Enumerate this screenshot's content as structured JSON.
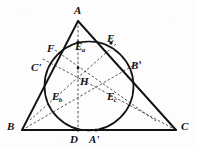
{
  "figure": {
    "background_color": "#fdfdfd",
    "ink_color": "#121212",
    "stroke_solid_width": 1.6,
    "stroke_dashed_width": 0.8,
    "dash_pattern": "2.5 2",
    "triangle": {
      "vertices": {
        "A": {
          "x": 78,
          "y": 21
        },
        "B": {
          "x": 22,
          "y": 130
        },
        "C": {
          "x": 176,
          "y": 130
        }
      }
    },
    "circle": {
      "cx": 89,
      "cy": 86,
      "r": 44.5
    },
    "orthocenter": {
      "x": 78,
      "y": 68
    },
    "points": [
      {
        "id": "D",
        "x": 78,
        "y": 130,
        "dot": true
      },
      {
        "id": "A'",
        "x": 96,
        "y": 130,
        "dot": true
      },
      {
        "id": "Ea",
        "x": 78,
        "y": 42,
        "dot": true
      },
      {
        "id": "E",
        "x": 111,
        "y": 43,
        "dot": true
      },
      {
        "id": "F",
        "x": 57,
        "y": 53,
        "dot": false
      },
      {
        "id": "C'",
        "x": 47,
        "y": 69,
        "dot": false
      },
      {
        "id": "B'",
        "x": 131,
        "y": 70,
        "dot": false
      },
      {
        "id": "Eb",
        "x": 60,
        "y": 107,
        "dot": false
      },
      {
        "id": "Ec",
        "x": 118,
        "y": 107,
        "dot": false
      }
    ],
    "cevians": [
      {
        "from": "A",
        "to": "D",
        "style": "dashed"
      },
      {
        "from": "B",
        "to": "B'",
        "style": "dashed"
      },
      {
        "from": "C",
        "to": "C'",
        "style": "dashed"
      },
      {
        "from": "B",
        "to": "Ec",
        "style": "dashed"
      },
      {
        "from": "C",
        "to": "Eb",
        "style": "dashed"
      },
      {
        "from": "F",
        "to": "Ec",
        "style": "dashed"
      },
      {
        "from": "E",
        "to": "Eb",
        "style": "dashed"
      }
    ]
  },
  "labels": {
    "A": {
      "text": "A",
      "prime": "",
      "sub": "",
      "x": 74,
      "y": 5
    },
    "B": {
      "text": "B",
      "prime": "",
      "sub": "",
      "x": 7,
      "y": 121
    },
    "C": {
      "text": "C",
      "prime": "",
      "sub": "",
      "x": 181,
      "y": 121
    },
    "D": {
      "text": "D",
      "prime": "",
      "sub": "",
      "x": 70,
      "y": 134
    },
    "Ap": {
      "text": "A",
      "prime": "'",
      "sub": "",
      "x": 89,
      "y": 134
    },
    "E": {
      "text": "E",
      "prime": "",
      "sub": "",
      "x": 107,
      "y": 33
    },
    "F": {
      "text": "F",
      "prime": "",
      "sub": "",
      "x": 47,
      "y": 43
    },
    "Cp": {
      "text": "C",
      "prime": "'",
      "sub": "",
      "x": 31,
      "y": 62
    },
    "Bp": {
      "text": "B",
      "prime": "'",
      "sub": "",
      "x": 131,
      "y": 60
    },
    "H": {
      "text": "H",
      "prime": "",
      "sub": "",
      "x": 80,
      "y": 76
    },
    "Ea": {
      "text": "E",
      "prime": "",
      "sub": "a",
      "x": 75,
      "y": 41
    },
    "Eb": {
      "text": "E",
      "prime": "",
      "sub": "b",
      "x": 52,
      "y": 91
    },
    "Ec": {
      "text": "E",
      "prime": "",
      "sub": "c",
      "x": 107,
      "y": 91
    }
  }
}
